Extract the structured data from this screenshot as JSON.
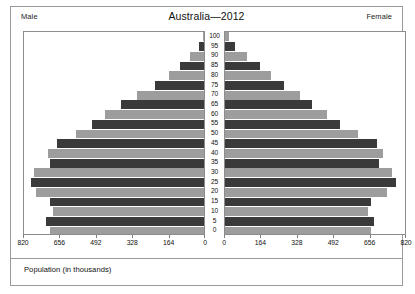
{
  "chart": {
    "title": "Australia—2012",
    "male_label": "Male",
    "female_label": "Female",
    "axis_caption": "Population (in thousands)",
    "colors": {
      "bar_dark": "#3a3a3a",
      "bar_light": "#9d9d9d",
      "panel_border": "#8d8d8d",
      "figure_border": "#9a9a9a",
      "text": "#111111"
    }
  },
  "chart_data": {
    "type": "bar",
    "subtype": "population-pyramid",
    "title": "Australia—2012",
    "xlabel": "Population (in thousands)",
    "ylabel": "",
    "grid": false,
    "legend_position": "corners",
    "orientation": "horizontal",
    "axis_units": "thousands",
    "xlim_left": [
      820,
      0
    ],
    "xlim_right": [
      0,
      820
    ],
    "xticks_left": [
      820,
      656,
      492,
      328,
      164,
      0
    ],
    "xticks_right": [
      0,
      164,
      328,
      492,
      656,
      820
    ],
    "categories": [
      "100",
      "95",
      "90",
      "85",
      "80",
      "75",
      "70",
      "65",
      "60",
      "55",
      "50",
      "45",
      "40",
      "35",
      "30",
      "25",
      "20",
      "15",
      "10",
      "5",
      "0"
    ],
    "series": [
      {
        "name": "Male",
        "side": "left",
        "values": [
          6,
          25,
          62,
          110,
          158,
          222,
          306,
          377,
          450,
          510,
          585,
          670,
          710,
          700,
          775,
          790,
          765,
          700,
          690,
          720,
          700
        ]
      },
      {
        "name": "Female",
        "side": "right",
        "values": [
          18,
          46,
          99,
          158,
          210,
          268,
          340,
          398,
          464,
          524,
          608,
          692,
          720,
          700,
          760,
          780,
          740,
          665,
          652,
          680,
          665
        ]
      }
    ]
  },
  "age_labels": [
    "100",
    "95",
    "90",
    "85",
    "80",
    "75",
    "70",
    "65",
    "60",
    "55",
    "50",
    "45",
    "40",
    "35",
    "30",
    "25",
    "20",
    "15",
    "10",
    "5",
    "0"
  ]
}
